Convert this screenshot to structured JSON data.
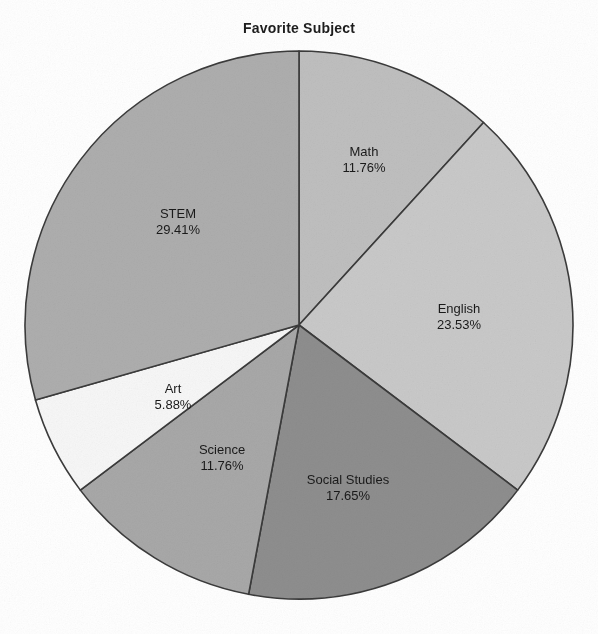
{
  "chart_data": {
    "type": "pie",
    "title": "Favorite Subject",
    "xlabel": "",
    "ylabel": "",
    "legend": "none",
    "grid": false,
    "start_angle_deg": 0,
    "direction": "clockwise",
    "categories": [
      "Math",
      "English",
      "Social Studies",
      "Science",
      "Art",
      "STEM"
    ],
    "values": [
      11.76,
      23.53,
      17.65,
      11.76,
      5.88,
      29.41
    ],
    "value_unit": "%",
    "slices": [
      {
        "label": "Math",
        "value": "11.76%",
        "value_num": 11.76,
        "color": "#bfbfbf",
        "label_x": 364,
        "label_y": 160
      },
      {
        "label": "English",
        "value": "23.53%",
        "value_num": 23.53,
        "color": "#c9c9c9",
        "label_x": 459,
        "label_y": 317
      },
      {
        "label": "Social Studies",
        "value": "17.65%",
        "value_num": 17.65,
        "color": "#8e8e8e",
        "label_x": 348,
        "label_y": 488
      },
      {
        "label": "Science",
        "value": "11.76%",
        "value_num": 11.76,
        "color": "#a8a8a8",
        "label_x": 222,
        "label_y": 458
      },
      {
        "label": "Art",
        "value": "5.88%",
        "value_num": 5.88,
        "color": "#f7f7f7",
        "label_x": 173,
        "label_y": 397
      },
      {
        "label": "STEM",
        "value": "29.41%",
        "value_num": 29.41,
        "color": "#aeaeae",
        "label_x": 178,
        "label_y": 222
      }
    ],
    "geometry": {
      "center_x": 299,
      "center_y": 325,
      "radius": 274
    },
    "stroke_color": "#3b3b3b"
  }
}
